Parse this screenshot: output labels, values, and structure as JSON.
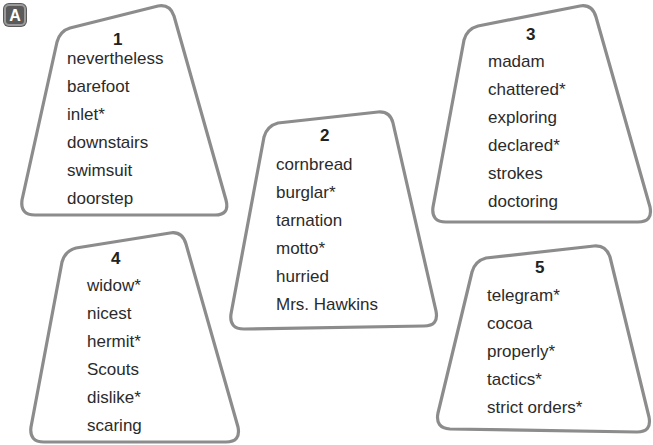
{
  "section_label": "A",
  "cards": [
    {
      "number": "1",
      "words": [
        "nevertheless",
        "barefoot",
        "inlet*",
        "downstairs",
        "swimsuit",
        "doorstep"
      ]
    },
    {
      "number": "2",
      "words": [
        "cornbread",
        "burglar*",
        "tarnation",
        "motto*",
        "hurried",
        "Mrs. Hawkins"
      ]
    },
    {
      "number": "3",
      "words": [
        "madam",
        "chattered*",
        "exploring",
        "declared*",
        "strokes",
        "doctoring"
      ]
    },
    {
      "number": "4",
      "words": [
        "widow*",
        "nicest",
        "hermit*",
        "Scouts",
        "dislike*",
        "scaring"
      ]
    },
    {
      "number": "5",
      "words": [
        "telegram*",
        "cocoa",
        "properly*",
        "tactics*",
        "strict orders*"
      ]
    }
  ],
  "colors": {
    "card_border": "#8c8c8c",
    "badge_fill": "#5a5a5a",
    "text": "#2b2b2b"
  }
}
